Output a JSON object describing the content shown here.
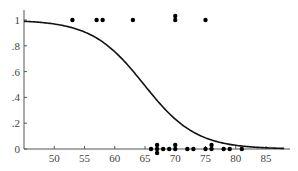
{
  "chart_data": {
    "type": "scatter",
    "title": "",
    "xlabel": "",
    "ylabel": "",
    "xlim": [
      45,
      88
    ],
    "ylim": [
      0,
      1.05
    ],
    "grid": false,
    "legend": null,
    "x_ticks": [
      50,
      55,
      60,
      65,
      70,
      75,
      80,
      85
    ],
    "x_tick_labels": [
      "50",
      "55",
      "60",
      "65",
      "70",
      "75",
      "80",
      "85"
    ],
    "y_ticks": [
      0,
      0.2,
      0.4,
      0.6,
      0.8,
      1
    ],
    "y_tick_labels": [
      "0",
      ".2",
      ".4",
      ".6",
      ".8",
      "1"
    ],
    "series": [
      {
        "name": "observations (y=1)",
        "kind": "points",
        "x": [
          53,
          57,
          58,
          63,
          70,
          70,
          75
        ],
        "y": [
          1,
          1,
          1,
          1,
          1,
          1,
          1
        ]
      },
      {
        "name": "observations (y=0)",
        "kind": "points",
        "x": [
          66,
          67,
          67,
          67,
          68,
          69,
          70,
          70,
          72,
          73,
          75,
          76,
          76,
          78,
          79,
          81
        ],
        "y": [
          0,
          0,
          0,
          0,
          0,
          0,
          0,
          0,
          0,
          0,
          0,
          0,
          0,
          0,
          0,
          0
        ]
      },
      {
        "name": "fitted logistic curve",
        "kind": "line",
        "model": "logistic",
        "intercept": 15.04,
        "slope": -0.232,
        "x_range": [
          45,
          88
        ]
      }
    ]
  }
}
